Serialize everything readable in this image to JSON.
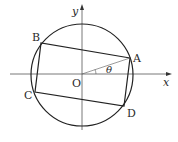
{
  "diagram": {
    "axes": {
      "x_label": "x",
      "y_label": "y"
    },
    "origin_label": "O",
    "angle_label": "θ",
    "points": [
      {
        "id": "A",
        "label": "A"
      },
      {
        "id": "B",
        "label": "B"
      },
      {
        "id": "C",
        "label": "C"
      },
      {
        "id": "D",
        "label": "D"
      }
    ],
    "colors": {
      "stroke": "#222222",
      "background": "#ffffff"
    }
  }
}
